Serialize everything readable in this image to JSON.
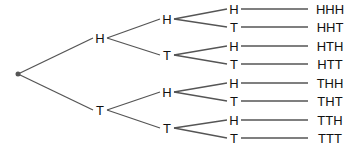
{
  "diagram": {
    "type": "probability-tree",
    "root": {
      "x": 18,
      "y": 74
    },
    "colors": {
      "line": "#555555",
      "text": "#111111",
      "root_dot": "#555555"
    },
    "level1": [
      {
        "label": "H",
        "x": 100,
        "y": 38
      },
      {
        "label": "T",
        "x": 100,
        "y": 110
      }
    ],
    "level2": [
      {
        "label": "H",
        "x": 167,
        "y": 19,
        "parent": 0
      },
      {
        "label": "T",
        "x": 167,
        "y": 55,
        "parent": 0
      },
      {
        "label": "H",
        "x": 167,
        "y": 92,
        "parent": 1
      },
      {
        "label": "T",
        "x": 167,
        "y": 128,
        "parent": 1
      }
    ],
    "level3": [
      {
        "label": "H",
        "x": 234,
        "y": 9,
        "parent": 0,
        "outcome": "HHH"
      },
      {
        "label": "T",
        "x": 234,
        "y": 27,
        "parent": 0,
        "outcome": "HHT"
      },
      {
        "label": "H",
        "x": 234,
        "y": 46,
        "parent": 1,
        "outcome": "HTH"
      },
      {
        "label": "T",
        "x": 234,
        "y": 64,
        "parent": 1,
        "outcome": "HTT"
      },
      {
        "label": "H",
        "x": 234,
        "y": 83,
        "parent": 2,
        "outcome": "THH"
      },
      {
        "label": "T",
        "x": 234,
        "y": 101,
        "parent": 2,
        "outcome": "THT"
      },
      {
        "label": "H",
        "x": 234,
        "y": 120,
        "parent": 3,
        "outcome": "TTH"
      },
      {
        "label": "T",
        "x": 234,
        "y": 138,
        "parent": 3,
        "outcome": "TTT"
      }
    ],
    "outcome_x": 330
  }
}
